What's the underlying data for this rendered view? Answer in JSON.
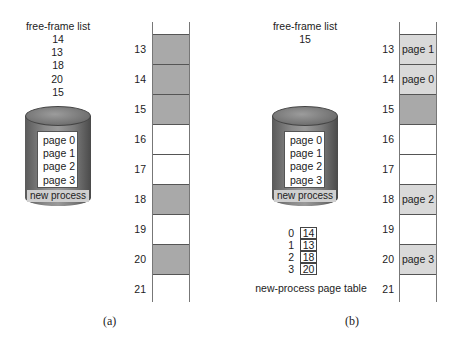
{
  "panel_a": {
    "caption": "(a)",
    "free_frame_list": {
      "title": "free-frame list",
      "items": [
        "14",
        "13",
        "18",
        "20",
        "15"
      ]
    },
    "disk": {
      "pages": [
        "page 0",
        "page 1",
        "page 2",
        "page 3"
      ],
      "label": "new process"
    },
    "frames": [
      {
        "num": "13",
        "state": "free",
        "content": ""
      },
      {
        "num": "14",
        "state": "free",
        "content": ""
      },
      {
        "num": "15",
        "state": "free",
        "content": ""
      },
      {
        "num": "16",
        "state": "occupied",
        "content": ""
      },
      {
        "num": "17",
        "state": "occupied",
        "content": ""
      },
      {
        "num": "18",
        "state": "free",
        "content": ""
      },
      {
        "num": "19",
        "state": "occupied",
        "content": ""
      },
      {
        "num": "20",
        "state": "free",
        "content": ""
      },
      {
        "num": "21",
        "state": "occupied",
        "content": ""
      }
    ]
  },
  "panel_b": {
    "caption": "(b)",
    "free_frame_list": {
      "title": "free-frame list",
      "items": [
        "15"
      ]
    },
    "disk": {
      "pages": [
        "page 0",
        "page 1",
        "page 2",
        "page 3"
      ],
      "label": "new process"
    },
    "frames": [
      {
        "num": "13",
        "state": "page",
        "content": "page 1"
      },
      {
        "num": "14",
        "state": "page",
        "content": "page 0"
      },
      {
        "num": "15",
        "state": "free",
        "content": ""
      },
      {
        "num": "16",
        "state": "occupied",
        "content": ""
      },
      {
        "num": "17",
        "state": "occupied",
        "content": ""
      },
      {
        "num": "18",
        "state": "page",
        "content": "page 2"
      },
      {
        "num": "19",
        "state": "occupied",
        "content": ""
      },
      {
        "num": "20",
        "state": "page",
        "content": "page 3"
      },
      {
        "num": "21",
        "state": "occupied",
        "content": ""
      }
    ],
    "page_table": {
      "label": "new-process page table",
      "entries": [
        {
          "index": "0",
          "frame": "14"
        },
        {
          "index": "1",
          "frame": "13"
        },
        {
          "index": "2",
          "frame": "18"
        },
        {
          "index": "3",
          "frame": "20"
        }
      ]
    }
  },
  "colors": {
    "free_frame": "#a9a9a9",
    "allocated_page": "#d9d9d9",
    "occupied_frame": "#ffffff"
  }
}
